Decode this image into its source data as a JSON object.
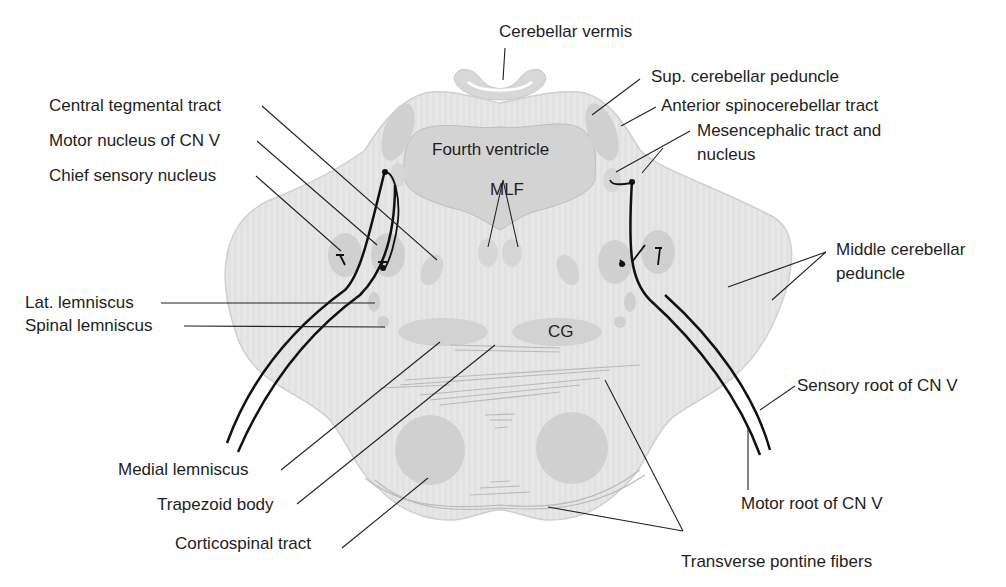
{
  "figure": {
    "colors": {
      "tissue": "#e6e6e6",
      "tissue_edge": "#c9c9c9",
      "nucleus": "#cfcfcf",
      "ventricle": "#d2d2d2",
      "nerve": "#111111",
      "leader": "#222222",
      "text": "#1e1e1e"
    }
  },
  "inner_labels": {
    "fourth_ventricle": "Fourth ventricle",
    "mlf": "MLF",
    "cg": "CG"
  },
  "labels": {
    "left": {
      "central_tegmental_tract": "Central tegmental tract",
      "motor_nucleus_cn_v": "Motor nucleus of CN V",
      "chief_sensory_nucleus": "Chief sensory nucleus",
      "lat_lemniscus": "Lat. lemniscus",
      "spinal_lemniscus": "Spinal lemniscus",
      "medial_lemniscus": "Medial lemniscus",
      "trapezoid_body": "Trapezoid body",
      "corticospinal_tract": "Corticospinal tract"
    },
    "right": {
      "cerebellar_vermis": "Cerebellar vermis",
      "sup_cerebellar_peduncle": "Sup. cerebellar peduncle",
      "anterior_spinocerebellar_tract": "Anterior spinocerebellar tract",
      "mesencephalic_line1": "Mesencephalic tract and",
      "mesencephalic_line2": "nucleus",
      "middle_cerebellar_line1": "Middle cerebellar",
      "middle_cerebellar_line2": "peduncle",
      "sensory_root_cn_v": "Sensory root of CN V",
      "motor_root_cn_v": "Motor root of CN V",
      "transverse_pontine_fibers": "Transverse pontine fibers"
    }
  }
}
